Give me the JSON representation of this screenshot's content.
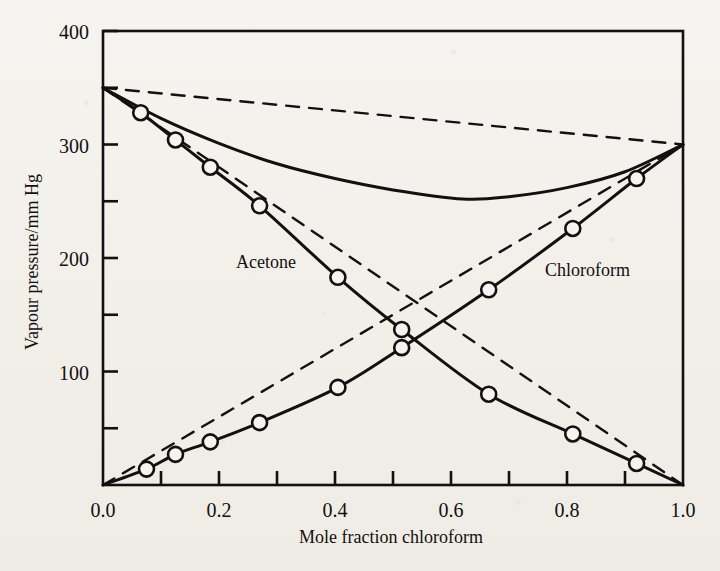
{
  "figure": {
    "axis_titles": {
      "x": "Mole fraction chloroform",
      "y": "Vapour pressure/mm Hg"
    },
    "series_labels": {
      "acetone": "Acetone",
      "chloroform": "Chloroform"
    },
    "x_tick_labels": [
      "0.0",
      "0.2",
      "0.4",
      "0.6",
      "0.8",
      "1.0"
    ],
    "y_tick_labels": [
      "100",
      "200",
      "300",
      "400"
    ],
    "colors": {
      "ink": "#111111",
      "paper": "#f4f2ee"
    }
  },
  "chart_data": {
    "type": "line",
    "title": "",
    "subtitle": "",
    "xlabel": "Mole fraction chloroform",
    "ylabel": "Vapour pressure/mm Hg",
    "xlim": [
      0.0,
      1.0
    ],
    "ylim": [
      0,
      400
    ],
    "x_major_ticks": [
      0.0,
      0.2,
      0.4,
      0.6,
      0.8,
      1.0
    ],
    "x_minor_ticks": [
      0.1,
      0.3,
      0.5,
      0.7,
      0.9
    ],
    "y_major_ticks": [
      100,
      200,
      300,
      400
    ],
    "y_minor_ticks": [
      50,
      150,
      250,
      350
    ],
    "grid": false,
    "legend": "inline-annotations",
    "annotations": [
      {
        "text": "Acetone",
        "x": 0.24,
        "y": 205
      },
      {
        "text": "Chloroform",
        "x": 0.78,
        "y": 200
      }
    ],
    "pure_component_pressures": {
      "acetone_mmHg": 350,
      "chloroform_mmHg": 300
    },
    "series": [
      {
        "name": "Acetone partial pressure (experimental)",
        "style": "solid",
        "markers": "open-circle",
        "x": [
          0.0,
          0.065,
          0.125,
          0.185,
          0.27,
          0.405,
          0.515,
          0.665,
          0.81,
          0.92,
          1.0
        ],
        "values": [
          350,
          328,
          304,
          280,
          246,
          183,
          137,
          80,
          45,
          19,
          0
        ]
      },
      {
        "name": "Chloroform partial pressure (experimental)",
        "style": "solid",
        "markers": "open-circle",
        "x": [
          0.0,
          0.075,
          0.125,
          0.185,
          0.27,
          0.405,
          0.515,
          0.665,
          0.81,
          0.92,
          1.0
        ],
        "values": [
          0,
          14,
          27,
          38,
          55,
          86,
          121,
          172,
          226,
          270,
          300
        ]
      },
      {
        "name": "Total vapour pressure (experimental)",
        "style": "solid",
        "markers": "none",
        "x": [
          0.0,
          0.1,
          0.2,
          0.3,
          0.4,
          0.5,
          0.62,
          0.7,
          0.8,
          0.9,
          1.0
        ],
        "values": [
          350,
          323,
          301,
          283,
          270,
          260,
          252,
          254,
          262,
          276,
          300
        ]
      },
      {
        "name": "Acetone partial pressure (Raoult's law)",
        "style": "dashed",
        "markers": "none",
        "x": [
          0.0,
          1.0
        ],
        "values": [
          350,
          0
        ]
      },
      {
        "name": "Chloroform partial pressure (Raoult's law)",
        "style": "dashed",
        "markers": "none",
        "x": [
          0.0,
          1.0
        ],
        "values": [
          0,
          300
        ]
      },
      {
        "name": "Total vapour pressure (Raoult's law)",
        "style": "dashed",
        "markers": "none",
        "x": [
          0.0,
          1.0
        ],
        "values": [
          350,
          300
        ]
      }
    ]
  }
}
